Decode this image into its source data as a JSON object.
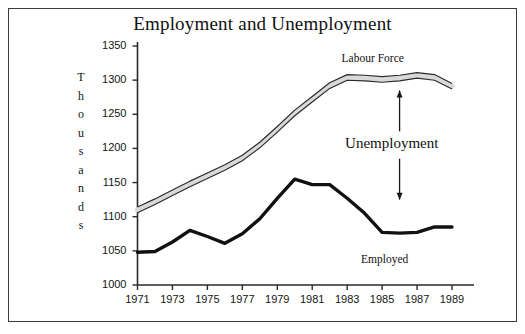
{
  "chart_data": {
    "type": "line",
    "title": "Employment and Unemployment",
    "xlabel": "",
    "ylabel": "Thousands",
    "ylabel_letters": [
      "T",
      "h",
      "o",
      "u",
      "s",
      "a",
      "n",
      "d",
      "s"
    ],
    "xlim": [
      1971,
      1989
    ],
    "ylim": [
      1000,
      1350
    ],
    "ytick_values": [
      1000,
      1050,
      1100,
      1150,
      1200,
      1250,
      1300,
      1350
    ],
    "ytick_labels": [
      "1000",
      "1050",
      "1100",
      "1150",
      "1200",
      "1250",
      "1300",
      "1350"
    ],
    "xtick_values": [
      1971,
      1973,
      1975,
      1977,
      1979,
      1981,
      1983,
      1985,
      1987,
      1989
    ],
    "xtick_labels": [
      "1971",
      "1973",
      "1975",
      "1977",
      "1979",
      "1981",
      "1983",
      "1985",
      "1987",
      "1989"
    ],
    "grid": false,
    "legend_position": "inline-annotations",
    "x": [
      1971,
      1972,
      1973,
      1974,
      1975,
      1976,
      1977,
      1978,
      1979,
      1980,
      1981,
      1982,
      1983,
      1984,
      1985,
      1986,
      1987,
      1988,
      1989
    ],
    "series": [
      {
        "name": "Labour Force",
        "style": "hollow-band",
        "color": "#d9d9d9",
        "edge_color": "#2b2b2b",
        "values": [
          1110,
          1122,
          1135,
          1148,
          1160,
          1172,
          1186,
          1205,
          1228,
          1252,
          1272,
          1292,
          1304,
          1303,
          1301,
          1303,
          1307,
          1304,
          1291
        ]
      },
      {
        "name": "Employed",
        "style": "thick-line",
        "color": "#111111",
        "values": [
          1048,
          1049,
          1063,
          1080,
          1071,
          1061,
          1075,
          1097,
          1127,
          1155,
          1147,
          1147,
          1127,
          1105,
          1077,
          1076,
          1077,
          1085,
          1085
        ]
      }
    ],
    "annotations": [
      {
        "name": "labour-force-label",
        "text": "Labour Force",
        "x": 1986.0,
        "y": 1330
      },
      {
        "name": "unemployment-label",
        "text": "Unemployment",
        "x": 1986.2,
        "y": 1205
      },
      {
        "name": "employed-label",
        "text": "Employed",
        "x": 1986.2,
        "y": 1035
      },
      {
        "name": "unemployment-arrow-up",
        "text": "↑",
        "x": 1986.0,
        "y": 1265
      },
      {
        "name": "unemployment-arrow-down",
        "text": "↓",
        "x": 1986.0,
        "y": 1145
      }
    ]
  }
}
